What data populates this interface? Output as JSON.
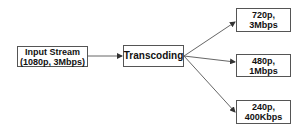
{
  "diagram": {
    "nodes": [
      {
        "id": "input",
        "lines": [
          "Input Stream",
          "(1080p, 3Mbps)"
        ]
      },
      {
        "id": "transcoding",
        "lines": [
          "Transcoding"
        ]
      },
      {
        "id": "out720",
        "lines": [
          "720p,",
          "3Mbps"
        ]
      },
      {
        "id": "out480",
        "lines": [
          "480p,",
          "1Mbps"
        ]
      },
      {
        "id": "out240",
        "lines": [
          "240p,",
          "400Kbps"
        ]
      }
    ],
    "edges": [
      {
        "from": "input",
        "to": "transcoding"
      },
      {
        "from": "transcoding",
        "to": "out720"
      },
      {
        "from": "transcoding",
        "to": "out480"
      },
      {
        "from": "transcoding",
        "to": "out240"
      }
    ],
    "colors": {
      "border": "#555555",
      "line": "#666666",
      "text": "#111111"
    }
  }
}
